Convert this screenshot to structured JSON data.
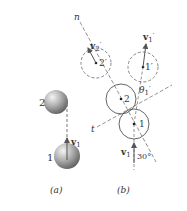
{
  "figure": {
    "part_a": {
      "caption": "(a)",
      "ball_2_label": "2",
      "ball_1_label": "1",
      "velocity_label": "v",
      "velocity_sub": "1"
    },
    "part_b": {
      "caption": "(b)",
      "normal_axis_label": "n",
      "tangent_axis_label": "t",
      "v2_prime_label": "v",
      "v2_prime_sub": "2",
      "v2_prime_mark": "′",
      "v1_prime_label": "v",
      "v1_prime_sub": "1",
      "v1_prime_mark": "′",
      "circle_2_prime_label": "2′",
      "circle_1_prime_label": "1′",
      "circle_2_label": "2",
      "circle_1_label": "1",
      "theta_label": "θ",
      "theta_sub": "1",
      "theta_mark": "′",
      "v1_label": "v",
      "v1_sub": "1",
      "angle_label": "30°"
    },
    "colors": {
      "line": "#555555",
      "dashed": "#777777",
      "text": "#333333"
    }
  }
}
